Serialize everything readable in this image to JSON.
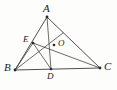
{
  "figure": {
    "kind": "euclidean-geometry-diagram",
    "background_color": "#fdfdfc",
    "stroke_color": "#3a3a3a",
    "label_color": "#1b1b1b",
    "width": 117,
    "height": 90
  },
  "points": {
    "A": {
      "label": "A",
      "x": 47,
      "y": 17,
      "label_x": 43,
      "label_y": 3,
      "size": "normal"
    },
    "B": {
      "label": "B",
      "x": 15,
      "y": 70,
      "label_x": 4,
      "label_y": 62,
      "size": "normal"
    },
    "C": {
      "label": "C",
      "x": 100,
      "y": 68,
      "label_x": 104,
      "label_y": 61,
      "size": "normal"
    },
    "D": {
      "label": "D",
      "x": 51,
      "y": 69,
      "label_x": 47,
      "label_y": 72,
      "size": "small"
    },
    "E": {
      "label": "E",
      "x": 33,
      "y": 43,
      "label_x": 23,
      "label_y": 35,
      "size": "small"
    },
    "O": {
      "label": "O",
      "x": 54,
      "y": 45,
      "label_x": 58,
      "label_y": 39,
      "size": "small"
    }
  },
  "segments": [
    {
      "name": "side-AB",
      "from": "A",
      "to": "B"
    },
    {
      "name": "side-AC",
      "from": "A",
      "to": "C"
    },
    {
      "name": "side-BC",
      "from": "B",
      "to": "C"
    },
    {
      "name": "cevian-AD",
      "from": "A",
      "to": "D"
    },
    {
      "name": "cevian-EC",
      "from": "E",
      "to": "C"
    },
    {
      "name": "segment-BE",
      "from": "B",
      "to": "E"
    },
    {
      "name": "segment-ED",
      "from": "E",
      "to": "D"
    },
    {
      "name": "segment-BO-extended",
      "from": "B",
      "to": "A",
      "via_o": true
    }
  ],
  "markers": {
    "dot_radius": 1.3,
    "visible_at": [
      "A",
      "B",
      "C",
      "D",
      "E",
      "O"
    ]
  }
}
